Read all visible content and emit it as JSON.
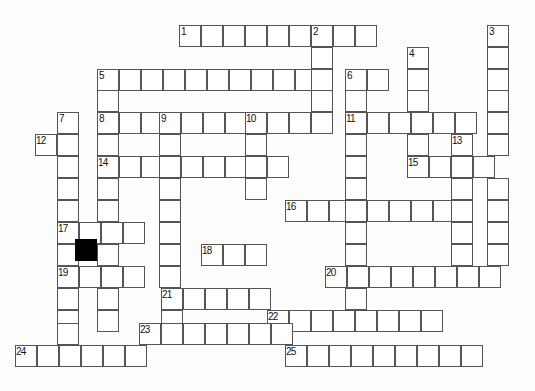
{
  "puzzle": {
    "title": "Crossword Grid",
    "type": "crossword",
    "width_px": 535,
    "height_px": 391,
    "cell_size_px": 22,
    "origin_x_px": 15,
    "origin_y_px": 25,
    "colors": {
      "grid_line": "#555555",
      "cell_fill": "#ffffff",
      "blocked_fill": "#000000",
      "number_text": "#111111",
      "background": "#fdfdfd"
    },
    "clue_numbers": [
      "1",
      "2",
      "3",
      "4",
      "5",
      "6",
      "7",
      "8",
      "9",
      "10",
      "11",
      "12",
      "13",
      "14",
      "15",
      "16",
      "17",
      "18",
      "19",
      "20",
      "21",
      "22",
      "23",
      "24",
      "25"
    ],
    "blocked_cells": [
      {
        "x": 75,
        "y": 239
      }
    ],
    "entries": [
      {
        "number": "1",
        "direction": "across",
        "x": 179,
        "y": 25,
        "length": 10
      },
      {
        "number": "2",
        "direction": "down",
        "x": 311,
        "y": 25,
        "length": 10
      },
      {
        "number": "3",
        "direction": "down",
        "x": 487,
        "y": 25,
        "length": 8
      },
      {
        "number": "4",
        "direction": "down",
        "x": 407,
        "y": 47,
        "length": 5
      },
      {
        "number": "5",
        "direction": "across",
        "x": 97,
        "y": 69,
        "length": 13
      },
      {
        "number": "6",
        "direction": "down",
        "x": 345,
        "y": 69,
        "length": 9
      },
      {
        "number": "7",
        "direction": "down",
        "x": 57,
        "y": 112,
        "length": 10
      },
      {
        "number": "8",
        "direction": "across",
        "x": 97,
        "y": 112,
        "length": 11
      },
      {
        "number": "9",
        "direction": "down",
        "x": 159,
        "y": 112,
        "length": 9
      },
      {
        "number": "10",
        "direction": "down",
        "x": 245,
        "y": 112,
        "length": 5
      },
      {
        "number": "11",
        "direction": "across",
        "x": 345,
        "y": 112,
        "length": 7
      },
      {
        "number": "12",
        "direction": "across",
        "x": 35,
        "y": 134,
        "length": 2
      },
      {
        "number": "13",
        "direction": "down",
        "x": 451,
        "y": 134,
        "length": 4
      },
      {
        "number": "14",
        "direction": "across",
        "x": 97,
        "y": 156,
        "length": 9
      },
      {
        "number": "15",
        "direction": "across",
        "x": 407,
        "y": 156,
        "length": 4
      },
      {
        "number": "16",
        "direction": "across",
        "x": 285,
        "y": 200,
        "length": 9
      },
      {
        "number": "17",
        "direction": "across",
        "x": 57,
        "y": 222,
        "length": 4
      },
      {
        "number": "18",
        "direction": "across",
        "x": 201,
        "y": 244,
        "length": 3
      },
      {
        "number": "19",
        "direction": "across",
        "x": 57,
        "y": 266,
        "length": 4
      },
      {
        "number": "20",
        "direction": "across",
        "x": 325,
        "y": 266,
        "length": 8
      },
      {
        "number": "21",
        "direction": "across",
        "x": 161,
        "y": 288,
        "length": 5
      },
      {
        "number": "22",
        "direction": "across",
        "x": 267,
        "y": 310,
        "length": 8
      },
      {
        "number": "23",
        "direction": "across",
        "x": 139,
        "y": 323,
        "length": 7
      },
      {
        "number": "24",
        "direction": "across",
        "x": 15,
        "y": 345,
        "length": 6
      },
      {
        "number": "25",
        "direction": "across",
        "x": 285,
        "y": 345,
        "length": 9
      }
    ],
    "cells": [
      {
        "x": 179,
        "y": 25,
        "num": "1"
      },
      {
        "x": 201,
        "y": 25
      },
      {
        "x": 223,
        "y": 25
      },
      {
        "x": 245,
        "y": 25
      },
      {
        "x": 267,
        "y": 25
      },
      {
        "x": 289,
        "y": 25
      },
      {
        "x": 311,
        "y": 25,
        "num": "2"
      },
      {
        "x": 333,
        "y": 25
      },
      {
        "x": 355,
        "y": 25
      },
      {
        "x": 487,
        "y": 25,
        "num": "3"
      },
      {
        "x": 311,
        "y": 47
      },
      {
        "x": 407,
        "y": 47,
        "num": "4"
      },
      {
        "x": 487,
        "y": 47
      },
      {
        "x": 97,
        "y": 69,
        "num": "5"
      },
      {
        "x": 119,
        "y": 69
      },
      {
        "x": 141,
        "y": 69
      },
      {
        "x": 163,
        "y": 69
      },
      {
        "x": 185,
        "y": 69
      },
      {
        "x": 207,
        "y": 69
      },
      {
        "x": 229,
        "y": 69
      },
      {
        "x": 251,
        "y": 69
      },
      {
        "x": 273,
        "y": 69
      },
      {
        "x": 295,
        "y": 69
      },
      {
        "x": 311,
        "y": 69
      },
      {
        "x": 345,
        "y": 69,
        "num": "6"
      },
      {
        "x": 367,
        "y": 69
      },
      {
        "x": 407,
        "y": 69
      },
      {
        "x": 487,
        "y": 69
      },
      {
        "x": 97,
        "y": 90
      },
      {
        "x": 311,
        "y": 90
      },
      {
        "x": 345,
        "y": 90
      },
      {
        "x": 407,
        "y": 90
      },
      {
        "x": 487,
        "y": 90
      },
      {
        "x": 57,
        "y": 112,
        "num": "7"
      },
      {
        "x": 97,
        "y": 112,
        "num": "8"
      },
      {
        "x": 119,
        "y": 112
      },
      {
        "x": 141,
        "y": 112
      },
      {
        "x": 159,
        "y": 112,
        "num": "9"
      },
      {
        "x": 181,
        "y": 112
      },
      {
        "x": 203,
        "y": 112
      },
      {
        "x": 225,
        "y": 112
      },
      {
        "x": 245,
        "y": 112,
        "num": "10"
      },
      {
        "x": 267,
        "y": 112
      },
      {
        "x": 289,
        "y": 112
      },
      {
        "x": 311,
        "y": 112
      },
      {
        "x": 345,
        "y": 112,
        "num": "11"
      },
      {
        "x": 367,
        "y": 112
      },
      {
        "x": 389,
        "y": 112
      },
      {
        "x": 411,
        "y": 112
      },
      {
        "x": 433,
        "y": 112
      },
      {
        "x": 455,
        "y": 112
      },
      {
        "x": 487,
        "y": 112
      },
      {
        "x": 35,
        "y": 134,
        "num": "12"
      },
      {
        "x": 57,
        "y": 134
      },
      {
        "x": 97,
        "y": 134
      },
      {
        "x": 159,
        "y": 134
      },
      {
        "x": 245,
        "y": 134
      },
      {
        "x": 345,
        "y": 134
      },
      {
        "x": 407,
        "y": 134
      },
      {
        "x": 451,
        "y": 134,
        "num": "13"
      },
      {
        "x": 487,
        "y": 134
      },
      {
        "x": 57,
        "y": 156
      },
      {
        "x": 97,
        "y": 156,
        "num": "14"
      },
      {
        "x": 119,
        "y": 156
      },
      {
        "x": 141,
        "y": 156
      },
      {
        "x": 159,
        "y": 156
      },
      {
        "x": 181,
        "y": 156
      },
      {
        "x": 203,
        "y": 156
      },
      {
        "x": 225,
        "y": 156
      },
      {
        "x": 245,
        "y": 156
      },
      {
        "x": 267,
        "y": 156
      },
      {
        "x": 345,
        "y": 156
      },
      {
        "x": 407,
        "y": 156,
        "num": "15"
      },
      {
        "x": 429,
        "y": 156
      },
      {
        "x": 451,
        "y": 156
      },
      {
        "x": 473,
        "y": 156
      },
      {
        "x": 57,
        "y": 178
      },
      {
        "x": 97,
        "y": 178
      },
      {
        "x": 159,
        "y": 178
      },
      {
        "x": 245,
        "y": 178
      },
      {
        "x": 345,
        "y": 178
      },
      {
        "x": 451,
        "y": 178
      },
      {
        "x": 487,
        "y": 178
      },
      {
        "x": 57,
        "y": 200
      },
      {
        "x": 97,
        "y": 200
      },
      {
        "x": 159,
        "y": 200
      },
      {
        "x": 285,
        "y": 200,
        "num": "16"
      },
      {
        "x": 307,
        "y": 200
      },
      {
        "x": 329,
        "y": 200
      },
      {
        "x": 345,
        "y": 200
      },
      {
        "x": 367,
        "y": 200
      },
      {
        "x": 389,
        "y": 200
      },
      {
        "x": 411,
        "y": 200
      },
      {
        "x": 433,
        "y": 200
      },
      {
        "x": 451,
        "y": 200
      },
      {
        "x": 487,
        "y": 200
      },
      {
        "x": 57,
        "y": 222,
        "num": "17"
      },
      {
        "x": 79,
        "y": 222
      },
      {
        "x": 101,
        "y": 222
      },
      {
        "x": 123,
        "y": 222
      },
      {
        "x": 159,
        "y": 222
      },
      {
        "x": 345,
        "y": 222
      },
      {
        "x": 451,
        "y": 222
      },
      {
        "x": 487,
        "y": 222
      },
      {
        "x": 57,
        "y": 244
      },
      {
        "x": 75,
        "y": 239,
        "blocked": true
      },
      {
        "x": 97,
        "y": 244
      },
      {
        "x": 159,
        "y": 244
      },
      {
        "x": 201,
        "y": 244,
        "num": "18"
      },
      {
        "x": 223,
        "y": 244
      },
      {
        "x": 245,
        "y": 244
      },
      {
        "x": 345,
        "y": 244
      },
      {
        "x": 451,
        "y": 244
      },
      {
        "x": 487,
        "y": 244
      },
      {
        "x": 57,
        "y": 266,
        "num": "19"
      },
      {
        "x": 79,
        "y": 266
      },
      {
        "x": 101,
        "y": 266
      },
      {
        "x": 123,
        "y": 266
      },
      {
        "x": 159,
        "y": 266
      },
      {
        "x": 325,
        "y": 266,
        "num": "20"
      },
      {
        "x": 347,
        "y": 266
      },
      {
        "x": 369,
        "y": 266
      },
      {
        "x": 391,
        "y": 266
      },
      {
        "x": 413,
        "y": 266
      },
      {
        "x": 435,
        "y": 266
      },
      {
        "x": 457,
        "y": 266
      },
      {
        "x": 479,
        "y": 266
      },
      {
        "x": 57,
        "y": 288
      },
      {
        "x": 97,
        "y": 288
      },
      {
        "x": 161,
        "y": 288,
        "num": "21"
      },
      {
        "x": 183,
        "y": 288
      },
      {
        "x": 205,
        "y": 288
      },
      {
        "x": 227,
        "y": 288
      },
      {
        "x": 249,
        "y": 288
      },
      {
        "x": 345,
        "y": 288
      },
      {
        "x": 57,
        "y": 310
      },
      {
        "x": 97,
        "y": 310
      },
      {
        "x": 161,
        "y": 310
      },
      {
        "x": 267,
        "y": 310,
        "num": "22"
      },
      {
        "x": 289,
        "y": 310
      },
      {
        "x": 311,
        "y": 310
      },
      {
        "x": 333,
        "y": 310
      },
      {
        "x": 355,
        "y": 310
      },
      {
        "x": 377,
        "y": 310
      },
      {
        "x": 399,
        "y": 310
      },
      {
        "x": 421,
        "y": 310
      },
      {
        "x": 57,
        "y": 323
      },
      {
        "x": 139,
        "y": 323,
        "num": "23"
      },
      {
        "x": 161,
        "y": 323
      },
      {
        "x": 183,
        "y": 323
      },
      {
        "x": 205,
        "y": 323
      },
      {
        "x": 227,
        "y": 323
      },
      {
        "x": 249,
        "y": 323
      },
      {
        "x": 271,
        "y": 323
      },
      {
        "x": 15,
        "y": 345,
        "num": "24"
      },
      {
        "x": 37,
        "y": 345
      },
      {
        "x": 59,
        "y": 345
      },
      {
        "x": 81,
        "y": 345
      },
      {
        "x": 103,
        "y": 345
      },
      {
        "x": 125,
        "y": 345
      },
      {
        "x": 285,
        "y": 345,
        "num": "25"
      },
      {
        "x": 307,
        "y": 345
      },
      {
        "x": 329,
        "y": 345
      },
      {
        "x": 351,
        "y": 345
      },
      {
        "x": 373,
        "y": 345
      },
      {
        "x": 395,
        "y": 345
      },
      {
        "x": 417,
        "y": 345
      },
      {
        "x": 439,
        "y": 345
      },
      {
        "x": 461,
        "y": 345
      }
    ]
  }
}
